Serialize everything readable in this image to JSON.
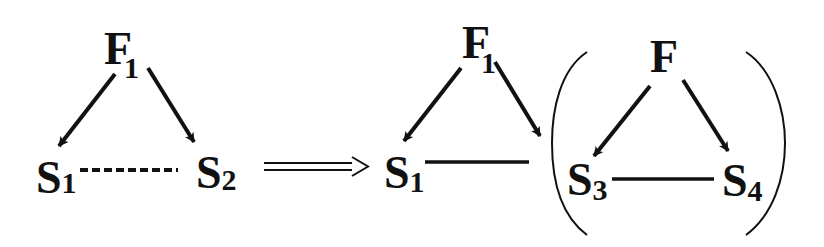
{
  "diagram": {
    "colors": {
      "ink": "#111111",
      "background": "#ffffff"
    },
    "left": {
      "top_node": {
        "label": "F",
        "subscript": "1"
      },
      "left_node": {
        "label": "S",
        "subscript": "1"
      },
      "right_node": {
        "label": "S",
        "subscript": "2"
      },
      "edges": [
        {
          "from": "F1",
          "to": "S1",
          "style": "arrow"
        },
        {
          "from": "F1",
          "to": "S2",
          "style": "arrow"
        },
        {
          "from": "S1",
          "to": "S2",
          "style": "dashed"
        }
      ]
    },
    "implies": {
      "symbol": "double-arrow-right"
    },
    "middle": {
      "top_node": {
        "label": "F",
        "subscript": "1"
      },
      "left_node": {
        "label": "S",
        "subscript": "1"
      },
      "edges": [
        {
          "from": "F1",
          "to": "S1",
          "style": "arrow"
        },
        {
          "from": "F1",
          "to": "bracket-group",
          "style": "arrow"
        },
        {
          "from": "S1",
          "to": "bracket-group",
          "style": "solid"
        }
      ]
    },
    "right": {
      "top_node": {
        "label": "F",
        "subscript": ""
      },
      "left_node": {
        "label": "S",
        "subscript": "3"
      },
      "right_node": {
        "label": "S",
        "subscript": "4"
      },
      "edges": [
        {
          "from": "F",
          "to": "S3",
          "style": "arrow"
        },
        {
          "from": "F",
          "to": "S4",
          "style": "arrow"
        },
        {
          "from": "S3",
          "to": "S4",
          "style": "solid"
        }
      ],
      "enclosure": "parentheses"
    }
  }
}
